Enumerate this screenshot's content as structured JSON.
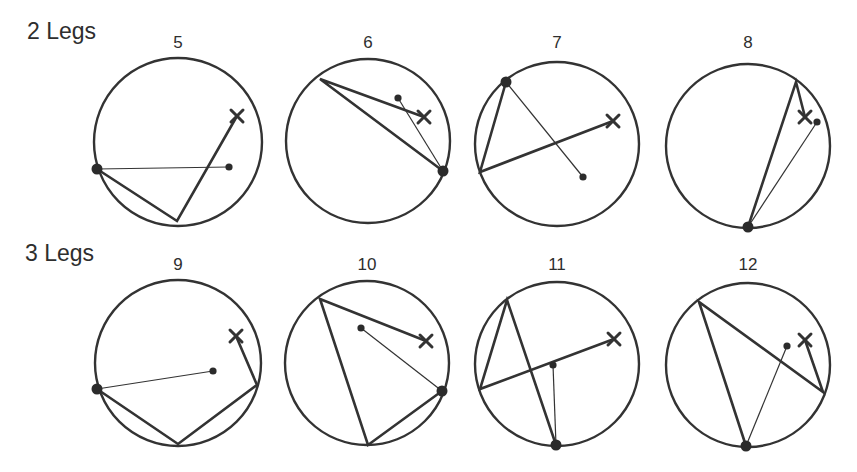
{
  "rows": [
    {
      "label": "2 Legs",
      "x": 27,
      "y": 18
    },
    {
      "label": "3 Legs",
      "x": 25,
      "y": 240
    }
  ],
  "diagrams": [
    {
      "number": "5",
      "legs": 2,
      "cx": 178,
      "cy": 142,
      "r": 84,
      "label_y": 43,
      "path": [
        [
          97,
          169
        ],
        [
          177,
          221
        ],
        [
          237,
          116
        ]
      ],
      "x_mark": [
        237,
        116
      ],
      "big_dot": [
        97,
        169
      ],
      "small_dot": [
        229,
        167
      ],
      "thin_line": [
        [
          97,
          169
        ],
        [
          229,
          167
        ]
      ]
    },
    {
      "number": "6",
      "legs": 2,
      "cx": 368,
      "cy": 141,
      "r": 82,
      "label_y": 43,
      "path": [
        [
          443,
          171
        ],
        [
          320,
          79
        ],
        [
          424,
          117
        ]
      ],
      "x_mark": [
        424,
        117
      ],
      "big_dot": [
        443,
        171
      ],
      "small_dot": [
        398,
        98
      ],
      "thin_line": [
        [
          443,
          171
        ],
        [
          398,
          98
        ]
      ]
    },
    {
      "number": "7",
      "legs": 2,
      "cx": 557,
      "cy": 144,
      "r": 82,
      "label_y": 43,
      "path": [
        [
          506,
          82
        ],
        [
          480,
          172
        ],
        [
          613,
          121
        ]
      ],
      "x_mark": [
        613,
        121
      ],
      "big_dot": [
        506,
        82
      ],
      "small_dot": [
        583,
        177
      ],
      "thin_line": [
        [
          506,
          82
        ],
        [
          583,
          177
        ]
      ]
    },
    {
      "number": "8",
      "legs": 2,
      "cx": 748,
      "cy": 146,
      "r": 82,
      "label_y": 43,
      "path": [
        [
          748,
          227
        ],
        [
          796,
          82
        ],
        [
          805,
          117
        ]
      ],
      "x_mark": [
        805,
        117
      ],
      "big_dot": [
        748,
        227
      ],
      "small_dot": [
        817,
        122
      ],
      "thin_line": [
        [
          748,
          227
        ],
        [
          817,
          122
        ]
      ]
    },
    {
      "number": "9",
      "legs": 3,
      "cx": 178,
      "cy": 363,
      "r": 83,
      "label_y": 262,
      "path": [
        [
          97,
          389
        ],
        [
          178,
          444
        ],
        [
          257,
          385
        ],
        [
          236,
          336
        ]
      ],
      "x_mark": [
        236,
        336
      ],
      "big_dot": [
        97,
        389
      ],
      "small_dot": [
        213,
        371
      ],
      "thin_line": [
        [
          97,
          389
        ],
        [
          213,
          371
        ]
      ]
    },
    {
      "number": "10",
      "legs": 3,
      "cx": 367,
      "cy": 363,
      "r": 82,
      "label_y": 262,
      "path": [
        [
          442,
          391
        ],
        [
          368,
          445
        ],
        [
          320,
          299
        ],
        [
          426,
          341
        ]
      ],
      "x_mark": [
        426,
        341
      ],
      "big_dot": [
        442,
        391
      ],
      "small_dot": [
        361,
        328
      ],
      "thin_line": [
        [
          442,
          391
        ],
        [
          361,
          328
        ]
      ]
    },
    {
      "number": "11",
      "legs": 3,
      "cx": 557,
      "cy": 364,
      "r": 82,
      "label_y": 262,
      "path": [
        [
          556,
          445
        ],
        [
          507,
          300
        ],
        [
          480,
          389
        ],
        [
          614,
          339
        ]
      ],
      "x_mark": [
        614,
        339
      ],
      "big_dot": [
        556,
        445
      ],
      "small_dot": [
        553,
        365
      ],
      "thin_line": [
        [
          556,
          445
        ],
        [
          553,
          365
        ]
      ]
    },
    {
      "number": "12",
      "legs": 3,
      "cx": 748,
      "cy": 365,
      "r": 82,
      "label_y": 262,
      "path": [
        [
          746,
          446
        ],
        [
          699,
          302
        ],
        [
          823,
          392
        ],
        [
          805,
          340
        ]
      ],
      "x_mark": [
        805,
        340
      ],
      "big_dot": [
        746,
        446
      ],
      "small_dot": [
        787,
        346
      ],
      "thin_line": [
        [
          746,
          446
        ],
        [
          787,
          346
        ]
      ]
    }
  ]
}
